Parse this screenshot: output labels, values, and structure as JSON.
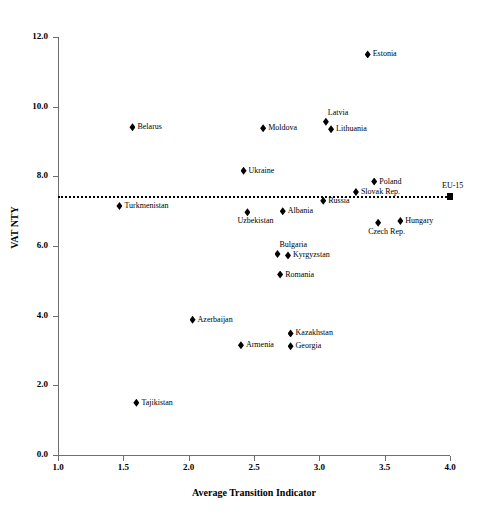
{
  "chart_data": {
    "type": "scatter",
    "title": "",
    "xlabel": "Average Transition Indicator",
    "ylabel": "VAT NTY",
    "xlim": [
      1.0,
      4.0
    ],
    "ylim": [
      0.0,
      12.0
    ],
    "xticks": [
      "1.0",
      "1.5",
      "2.0",
      "2.5",
      "3.0",
      "3.5",
      "4.0"
    ],
    "xtick_values": [
      1.0,
      1.5,
      2.0,
      2.5,
      3.0,
      3.5,
      4.0
    ],
    "yticks": [
      "0.0",
      "2.0",
      "4.0",
      "6.0",
      "8.0",
      "10.0",
      "12.0"
    ],
    "ytick_values": [
      0.0,
      2.0,
      4.0,
      6.0,
      8.0,
      10.0,
      12.0
    ],
    "grid": false,
    "legend": "none",
    "marker_color": "#000000",
    "reference_line": {
      "label": "EU-15 benchmark",
      "y": 7.43,
      "x_start": 1.0,
      "x_end": 4.0,
      "style": "dotted"
    },
    "points": [
      {
        "name": "Estonia",
        "x": 3.37,
        "y": 11.5,
        "marker": "diamond",
        "label_pos": "right"
      },
      {
        "name": "Belarus",
        "x": 1.57,
        "y": 9.41,
        "marker": "diamond",
        "label_pos": "right"
      },
      {
        "name": "Moldova",
        "x": 2.57,
        "y": 9.38,
        "marker": "diamond",
        "label_pos": "right"
      },
      {
        "name": "Latvia",
        "x": 3.05,
        "y": 9.57,
        "marker": "diamond",
        "label_pos": "above-right"
      },
      {
        "name": "Lithuania",
        "x": 3.09,
        "y": 9.35,
        "marker": "diamond",
        "label_pos": "right"
      },
      {
        "name": "Ukraine",
        "x": 2.42,
        "y": 8.16,
        "marker": "diamond",
        "label_pos": "right"
      },
      {
        "name": "Poland",
        "x": 3.42,
        "y": 7.85,
        "marker": "diamond",
        "label_pos": "right"
      },
      {
        "name": "Slovak Rep.",
        "x": 3.28,
        "y": 7.55,
        "marker": "diamond",
        "label_pos": "right"
      },
      {
        "name": "EU-15",
        "x": 4.0,
        "y": 7.43,
        "marker": "square",
        "label_pos": "above"
      },
      {
        "name": "Russia",
        "x": 3.03,
        "y": 7.3,
        "marker": "diamond",
        "label_pos": "right"
      },
      {
        "name": "Turkmenistan",
        "x": 1.47,
        "y": 7.15,
        "marker": "diamond",
        "label_pos": "right"
      },
      {
        "name": "Albania",
        "x": 2.72,
        "y": 7.0,
        "marker": "diamond",
        "label_pos": "right"
      },
      {
        "name": "Uzbekistan",
        "x": 2.45,
        "y": 6.97,
        "marker": "diamond",
        "label_pos": "below"
      },
      {
        "name": "Hungary",
        "x": 3.62,
        "y": 6.72,
        "marker": "diamond",
        "label_pos": "right"
      },
      {
        "name": "Czech Rep.",
        "x": 3.45,
        "y": 6.67,
        "marker": "diamond",
        "label_pos": "below"
      },
      {
        "name": "Bulgaria",
        "x": 2.68,
        "y": 5.77,
        "marker": "diamond",
        "label_pos": "above-right"
      },
      {
        "name": "Kyrgyzstan",
        "x": 2.76,
        "y": 5.73,
        "marker": "diamond",
        "label_pos": "right"
      },
      {
        "name": "Romania",
        "x": 2.7,
        "y": 5.18,
        "marker": "diamond",
        "label_pos": "right"
      },
      {
        "name": "Kazakhstan",
        "x": 2.78,
        "y": 3.49,
        "marker": "diamond",
        "label_pos": "right"
      },
      {
        "name": "Azerbaijan",
        "x": 2.03,
        "y": 3.88,
        "marker": "diamond",
        "label_pos": "right"
      },
      {
        "name": "Georgia",
        "x": 2.78,
        "y": 3.12,
        "marker": "diamond",
        "label_pos": "right"
      },
      {
        "name": "Armenia",
        "x": 2.4,
        "y": 3.15,
        "marker": "diamond",
        "label_pos": "right"
      },
      {
        "name": "Tajikistan",
        "x": 1.6,
        "y": 1.5,
        "marker": "diamond",
        "label_pos": "right"
      }
    ]
  }
}
